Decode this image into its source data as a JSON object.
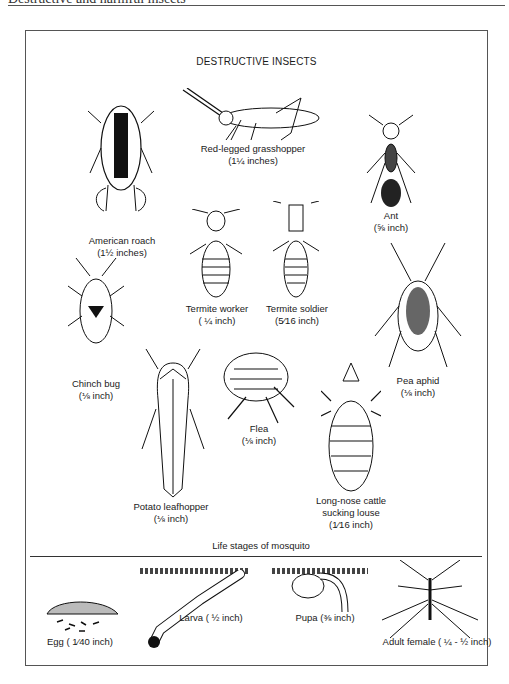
{
  "page_header": {
    "text": "Destructive and harmful insects"
  },
  "figure": {
    "title": "DESTRUCTIVE INSECTS",
    "insects": [
      {
        "id": "american-roach",
        "name": "American roach",
        "size": "(1½ inches)"
      },
      {
        "id": "grasshopper",
        "name": "Red-legged grasshopper",
        "size": "(1¼ inches)"
      },
      {
        "id": "ant",
        "name": "Ant",
        "size": "(⅝ inch)"
      },
      {
        "id": "termite-worker",
        "name": "Termite worker",
        "size": "( ¼ inch)"
      },
      {
        "id": "termite-soldier",
        "name": "Termite soldier",
        "size": "(5⁄16 inch)"
      },
      {
        "id": "chinch-bug",
        "name": "Chinch bug",
        "size": "(⅛ inch)"
      },
      {
        "id": "pea-aphid",
        "name": "Pea aphid",
        "size": "(⅛ inch)"
      },
      {
        "id": "flea",
        "name": "Flea",
        "size": "(⅛ inch)"
      },
      {
        "id": "potato-leafhopper",
        "name": "Potato leafhopper",
        "size": "(⅛ inch)"
      },
      {
        "id": "cattle-louse",
        "name": "Long-nose cattle",
        "name2": "sucking louse",
        "size": "(1⁄16 inch)"
      }
    ],
    "mosquito_section": {
      "title": "Life stages of mosquito",
      "stages": [
        {
          "id": "egg",
          "label": "Egg ( 1⁄40 inch)"
        },
        {
          "id": "larva",
          "label": "Larva ( ½ inch)"
        },
        {
          "id": "pupa",
          "label": "Pupa (⅜ inch)"
        },
        {
          "id": "adult",
          "label": "Adult female ( ¼ - ½ inch)"
        }
      ]
    }
  }
}
